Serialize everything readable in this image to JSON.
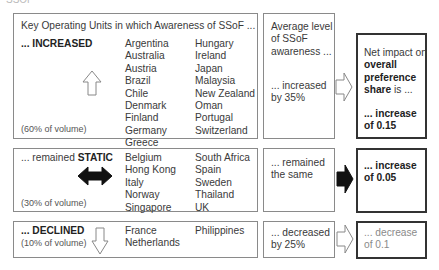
{
  "fragment_top": "SSOF",
  "header": "Key Operating Units in which Awareness of SSoF ...",
  "rows": [
    {
      "id": "increased",
      "prefix": "... ",
      "label": "INCREASED",
      "volume": "(60% of volume)",
      "arrow": "up-outline",
      "col1": [
        "Argentina",
        "Australia",
        "Austria",
        "Brazil",
        "Chile",
        "Denmark",
        "Finland",
        "Germany",
        "Greece"
      ],
      "col2": [
        "Hungary",
        "Ireland",
        "Japan",
        "Malaysia",
        "New Zealand",
        "Oman",
        "Portugal",
        "Switzerland"
      ],
      "awareness_title": [
        "Average level",
        "of SSoF",
        "awareness ..."
      ],
      "awareness": [
        "... increased",
        "by 35%"
      ],
      "impact_title_pre": "Net impact on",
      "impact_title_bold1": "overall",
      "impact_title_bold2": "preference",
      "impact_title_bold3": "share",
      "impact_title_post": " is ...",
      "impact": [
        "... increase",
        "of 0.15"
      ]
    },
    {
      "id": "static",
      "prefix": "... remained ",
      "label": "STATIC",
      "volume": "(30% of volume)",
      "arrow": "left-right-solid",
      "col1": [
        "Belgium",
        "Hong Kong",
        "Italy",
        "Norway",
        "Singapore"
      ],
      "col2": [
        "South Africa",
        "Spain",
        "Sweden",
        "Thailand",
        "UK"
      ],
      "awareness": [
        "... remained",
        "the same"
      ],
      "impact": [
        "...  increase",
        "of 0.05"
      ]
    },
    {
      "id": "declined",
      "prefix": "... ",
      "label": "DECLINED",
      "volume": "(10% of volume)",
      "arrow": "down-outline",
      "col1": [
        "France",
        "Netherlands"
      ],
      "col2": [
        "Philippines"
      ],
      "awareness": [
        "... decreased",
        "by 25%"
      ],
      "impact": [
        "... decrease",
        "of 0.1"
      ]
    }
  ]
}
